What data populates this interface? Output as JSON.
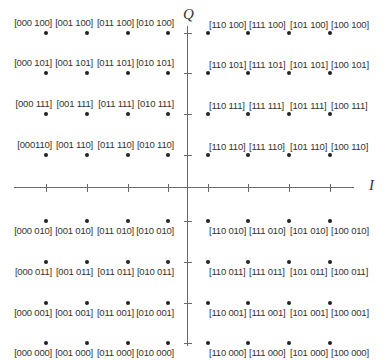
{
  "chart_data": {
    "type": "scatter",
    "title": "",
    "xlabel": "I",
    "ylabel": "Q",
    "grid": false,
    "x_levels": [
      -7,
      -5,
      -3,
      -1,
      1,
      3,
      5,
      7
    ],
    "y_levels": [
      7,
      5,
      3,
      1,
      -1,
      -3,
      -5,
      -7
    ],
    "i_bits": [
      "000",
      "001",
      "011",
      "010",
      "110",
      "111",
      "101",
      "100"
    ],
    "q_bits": [
      "100",
      "101",
      "111",
      "110",
      "010",
      "011",
      "001",
      "000"
    ],
    "points": [
      {
        "x": -7,
        "y": 7,
        "label": "[000 100]"
      },
      {
        "x": -5,
        "y": 7,
        "label": "[001 100]"
      },
      {
        "x": -3,
        "y": 7,
        "label": "[011 100]"
      },
      {
        "x": -1,
        "y": 7,
        "label": "[010 100]"
      },
      {
        "x": 1,
        "y": 7,
        "label": "[110 100]"
      },
      {
        "x": 3,
        "y": 7,
        "label": "[111 100]"
      },
      {
        "x": 5,
        "y": 7,
        "label": "[101 100]"
      },
      {
        "x": 7,
        "y": 7,
        "label": "[100 100]"
      },
      {
        "x": -7,
        "y": 5,
        "label": "[000 101]"
      },
      {
        "x": -5,
        "y": 5,
        "label": "[001 101]"
      },
      {
        "x": -3,
        "y": 5,
        "label": "[011 101]"
      },
      {
        "x": -1,
        "y": 5,
        "label": "[010 101]"
      },
      {
        "x": 1,
        "y": 5,
        "label": "[110 101]"
      },
      {
        "x": 3,
        "y": 5,
        "label": "[111 101]"
      },
      {
        "x": 5,
        "y": 5,
        "label": "[101 101]"
      },
      {
        "x": 7,
        "y": 5,
        "label": "[100 101]"
      },
      {
        "x": -7,
        "y": 3,
        "label": "[000 111]"
      },
      {
        "x": -5,
        "y": 3,
        "label": "[001 111]"
      },
      {
        "x": -3,
        "y": 3,
        "label": "[011 111]"
      },
      {
        "x": -1,
        "y": 3,
        "label": "[010 111]"
      },
      {
        "x": 1,
        "y": 3,
        "label": "[110 111]"
      },
      {
        "x": 3,
        "y": 3,
        "label": "[111 111]"
      },
      {
        "x": 5,
        "y": 3,
        "label": "[101 111]"
      },
      {
        "x": 7,
        "y": 3,
        "label": "[100 111]"
      },
      {
        "x": -7,
        "y": 1,
        "label": "[000110]"
      },
      {
        "x": -5,
        "y": 1,
        "label": "[001 110]"
      },
      {
        "x": -3,
        "y": 1,
        "label": "[011 110]"
      },
      {
        "x": -1,
        "y": 1,
        "label": "[010 110]"
      },
      {
        "x": 1,
        "y": 1,
        "label": "[110 110]"
      },
      {
        "x": 3,
        "y": 1,
        "label": "[111 110]"
      },
      {
        "x": 5,
        "y": 1,
        "label": "[101 110]"
      },
      {
        "x": 7,
        "y": 1,
        "label": "[100 110]"
      },
      {
        "x": -7,
        "y": -1,
        "label": "[000 010]"
      },
      {
        "x": -5,
        "y": -1,
        "label": "[001 010]"
      },
      {
        "x": -3,
        "y": -1,
        "label": "[011 010]"
      },
      {
        "x": -1,
        "y": -1,
        "label": "[010 010]"
      },
      {
        "x": 1,
        "y": -1,
        "label": "[110 010]"
      },
      {
        "x": 3,
        "y": -1,
        "label": "[111 010]"
      },
      {
        "x": 5,
        "y": -1,
        "label": "[101 010]"
      },
      {
        "x": 7,
        "y": -1,
        "label": "[100 010]"
      },
      {
        "x": -7,
        "y": -3,
        "label": "[000 011]"
      },
      {
        "x": -5,
        "y": -3,
        "label": "[001 011]"
      },
      {
        "x": -3,
        "y": -3,
        "label": "[011 011]"
      },
      {
        "x": -1,
        "y": -3,
        "label": "[010 011]"
      },
      {
        "x": 1,
        "y": -3,
        "label": "[110 011]"
      },
      {
        "x": 3,
        "y": -3,
        "label": "[111 011]"
      },
      {
        "x": 5,
        "y": -3,
        "label": "[101 011]"
      },
      {
        "x": 7,
        "y": -3,
        "label": "[100 011]"
      },
      {
        "x": -7,
        "y": -5,
        "label": "[000 001]"
      },
      {
        "x": -5,
        "y": -5,
        "label": "[001 001]"
      },
      {
        "x": -3,
        "y": -5,
        "label": "[011 001]"
      },
      {
        "x": -1,
        "y": -5,
        "label": "[010 001]"
      },
      {
        "x": 1,
        "y": -5,
        "label": "[110 001]"
      },
      {
        "x": 3,
        "y": -5,
        "label": "[111 001]"
      },
      {
        "x": 5,
        "y": -5,
        "label": "[101 001]"
      },
      {
        "x": 7,
        "y": -5,
        "label": "[100 001]"
      },
      {
        "x": -7,
        "y": -7,
        "label": "[000 000]"
      },
      {
        "x": -5,
        "y": -7,
        "label": "[001 000]"
      },
      {
        "x": -3,
        "y": -7,
        "label": "[011 000]"
      },
      {
        "x": -1,
        "y": -7,
        "label": "[010 000]"
      },
      {
        "x": 1,
        "y": -7,
        "label": "[110 000]"
      },
      {
        "x": 3,
        "y": -7,
        "label": "[111 000]"
      },
      {
        "x": 5,
        "y": -7,
        "label": "[101 000]"
      },
      {
        "x": 7,
        "y": -7,
        "label": "[100 000]"
      }
    ]
  },
  "axes": {
    "x_label": "I",
    "y_label": "Q"
  },
  "layout": {
    "col_px": [
      46,
      87,
      128,
      168,
      208,
      248,
      289,
      330
    ],
    "row_px": [
      33,
      73,
      114,
      155,
      221,
      262,
      303,
      343
    ],
    "origin_px": [
      188,
      188
    ]
  }
}
